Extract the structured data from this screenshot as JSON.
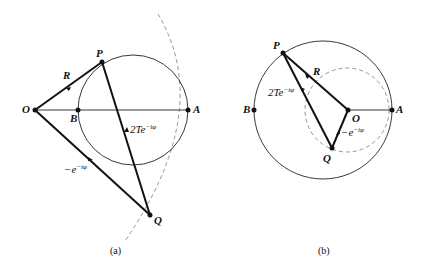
{
  "figures": [
    {
      "id": "a",
      "caption": "(a)",
      "points": {
        "O": {
          "label": "O",
          "x": 35,
          "y": 110
        },
        "P": {
          "label": "P",
          "x": 102,
          "y": 62
        },
        "B": {
          "label": "B",
          "x": 78,
          "y": 110
        },
        "A": {
          "label": "A",
          "x": 188,
          "y": 110
        },
        "Q": {
          "label": "Q",
          "x": 150,
          "y": 215
        }
      },
      "vectors": {
        "OP": {
          "label": "R"
        },
        "QP": {
          "label_main": "2Te",
          "label_sup": "−iφ"
        },
        "OQ": {
          "label_main": "−e",
          "label_sup": "−iφ"
        }
      }
    },
    {
      "id": "b",
      "caption": "(b)",
      "points": {
        "O": {
          "label": "O",
          "x": 348,
          "y": 110
        },
        "P": {
          "label": "P",
          "x": 283,
          "y": 53
        },
        "B": {
          "label": "B",
          "x": 254,
          "y": 110
        },
        "A": {
          "label": "A",
          "x": 392,
          "y": 110
        },
        "Q": {
          "label": "Q",
          "x": 332,
          "y": 148
        }
      },
      "vectors": {
        "OP": {
          "label": "R"
        },
        "QP": {
          "label_main": "2Te",
          "label_sup": "−iφ"
        },
        "OQ": {
          "label_main": "−e",
          "label_sup": "−iφ"
        }
      }
    }
  ],
  "colors": {
    "ink": "#111111",
    "dashed": "#888888",
    "background": "#ffffff"
  }
}
